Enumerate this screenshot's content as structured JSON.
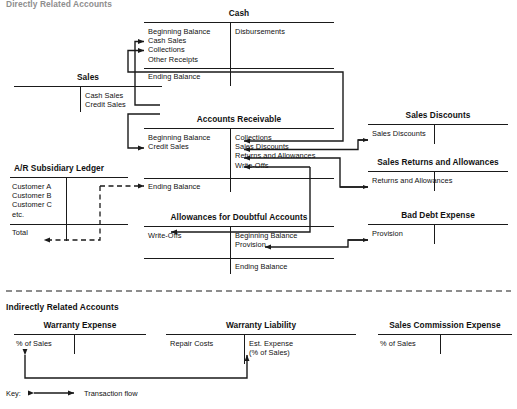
{
  "sections": {
    "directly_related": "Directly Related Accounts",
    "indirectly_related": "Indirectly Related Accounts"
  },
  "accounts": {
    "cash": {
      "title": "Cash",
      "debits": [
        "Beginning Balance",
        "Cash Sales",
        "Collections",
        "Other Receipts"
      ],
      "credits": [
        "Disbursements"
      ],
      "ending": "Ending Balance"
    },
    "sales": {
      "title": "Sales",
      "debits": [],
      "credits": [
        "Cash Sales",
        "Credit Sales"
      ]
    },
    "accounts_receivable": {
      "title": "Accounts Receivable",
      "debits": [
        "Beginning Balance",
        "Credit Sales"
      ],
      "credits": [
        "Collections",
        "Sales Discounts",
        "Returns and Allowances",
        "Write-Offs"
      ],
      "ending": "Ending Balance"
    },
    "sales_discounts": {
      "title": "Sales Discounts",
      "debits": [
        "Sales Discounts"
      ],
      "credits": []
    },
    "sales_returns_allowances": {
      "title": "Sales Returns and Allowances",
      "debits": [
        "Returns and Allowances"
      ],
      "credits": []
    },
    "ar_subsidiary_ledger": {
      "title": "A/R Subsidiary Ledger",
      "debits": [
        "Customer A",
        "Customer B",
        "Customer C",
        "etc."
      ],
      "total": "Total"
    },
    "allowances_doubtful": {
      "title": "Allowances for Doubtful Accounts",
      "debits": [
        "Write-Offs"
      ],
      "credits": [
        "Beginning Balance",
        "Provision"
      ],
      "ending": "Ending Balance"
    },
    "bad_debt_expense": {
      "title": "Bad Debt Expense",
      "debits": [
        "Provision"
      ],
      "credits": []
    },
    "warranty_expense": {
      "title": "Warranty Expense",
      "debits": [
        "% of Sales"
      ],
      "credits": []
    },
    "warranty_liability": {
      "title": "Warranty Liability",
      "debits": [
        "Repair Costs"
      ],
      "credits": [
        "Est. Expense",
        "(% of Sales)"
      ]
    },
    "sales_commission_expense": {
      "title": "Sales Commission Expense",
      "debits": [
        "% of Sales"
      ],
      "credits": []
    }
  },
  "key": {
    "label": "Key:",
    "legend": "Transaction flow"
  },
  "colors": {
    "ink": "#1a1a1a",
    "background": "#ffffff"
  }
}
